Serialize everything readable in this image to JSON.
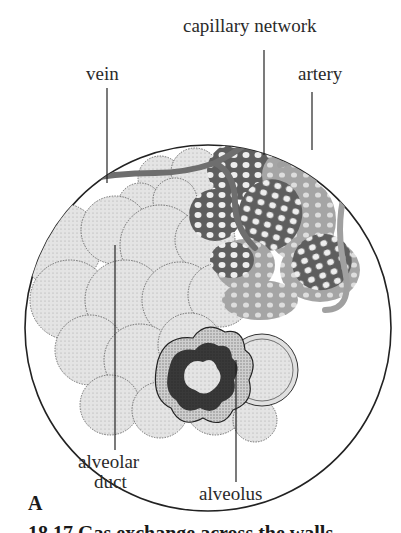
{
  "labels": {
    "capillary_network": "capillary network",
    "vein": "vein",
    "artery": "artery",
    "alveolar_duct": [
      "alveolar",
      "duct"
    ],
    "alveolus": "alveolus"
  },
  "panel_letter": "A",
  "caption": "18.17   Gas exchange across the walls",
  "colors": {
    "alveoli_fill": "#e6e6e6",
    "vessel_dark": "#6a6a6a",
    "vessel_light": "#a8a8a8",
    "outline": "#222222",
    "background": "#ffffff"
  }
}
